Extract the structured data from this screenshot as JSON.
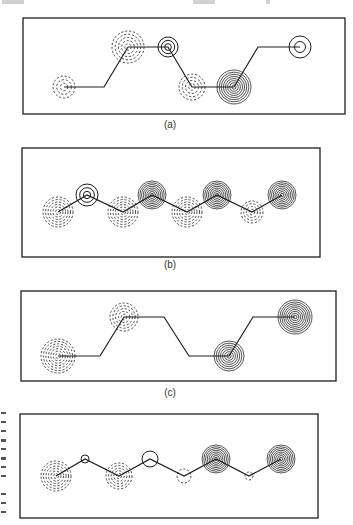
{
  "figure": {
    "colors": {
      "ink": "#1e1e1e",
      "paper": "#ffffff"
    },
    "panels": [
      {
        "id": "a",
        "label": "(a)",
        "box": {
          "x": 23,
          "y": 18,
          "w": 322,
          "h": 96
        },
        "label_pos": {
          "x": 170,
          "y": 120
        },
        "path": [
          [
            64,
            87
          ],
          [
            104,
            87
          ],
          [
            128,
            47
          ],
          [
            168,
            47
          ],
          [
            192,
            87
          ],
          [
            234,
            87
          ],
          [
            258,
            47
          ],
          [
            300,
            47
          ]
        ],
        "orbitals": [
          {
            "x": 64,
            "y": 87,
            "r": 11,
            "rings": 3,
            "sign": "negative"
          },
          {
            "x": 128,
            "y": 47,
            "r": 16,
            "rings": 5,
            "sign": "negative"
          },
          {
            "x": 168,
            "y": 47,
            "r": 10,
            "rings": 3,
            "sign": "positive"
          },
          {
            "x": 192,
            "y": 87,
            "r": 13,
            "rings": 4,
            "sign": "negative"
          },
          {
            "x": 234,
            "y": 87,
            "r": 17,
            "rings": 8,
            "sign": "positive"
          },
          {
            "x": 300,
            "y": 47,
            "r": 11,
            "rings": 2,
            "sign": "positive"
          }
        ]
      },
      {
        "id": "b",
        "label": "(b)",
        "box": {
          "x": 22,
          "y": 148,
          "w": 298,
          "h": 109
        },
        "label_pos": {
          "x": 155,
          "y": 260
        },
        "path": [
          [
            58,
            212
          ],
          [
            87,
            195
          ],
          [
            123,
            212
          ],
          [
            152,
            195
          ],
          [
            187,
            212
          ],
          [
            217,
            195
          ],
          [
            252,
            212
          ],
          [
            282,
            195
          ]
        ],
        "orbitals": [
          {
            "x": 58,
            "y": 212,
            "r": 15,
            "rings": 6,
            "sign": "negative"
          },
          {
            "x": 87,
            "y": 195,
            "r": 11,
            "rings": 3,
            "sign": "positive"
          },
          {
            "x": 123,
            "y": 212,
            "r": 15,
            "rings": 6,
            "sign": "negative"
          },
          {
            "x": 152,
            "y": 195,
            "r": 14,
            "rings": 8,
            "sign": "positive"
          },
          {
            "x": 187,
            "y": 212,
            "r": 15,
            "rings": 6,
            "sign": "negative"
          },
          {
            "x": 217,
            "y": 195,
            "r": 14,
            "rings": 8,
            "sign": "positive"
          },
          {
            "x": 252,
            "y": 212,
            "r": 11,
            "rings": 4,
            "sign": "negative"
          },
          {
            "x": 282,
            "y": 195,
            "r": 14,
            "rings": 8,
            "sign": "positive"
          }
        ]
      },
      {
        "id": "c",
        "label": "(c)",
        "box": {
          "x": 21,
          "y": 291,
          "w": 315,
          "h": 90
        },
        "label_pos": {
          "x": 155,
          "y": 387
        },
        "path": [
          [
            58,
            356
          ],
          [
            100,
            356
          ],
          [
            124,
            317
          ],
          [
            164,
            317
          ],
          [
            189,
            356
          ],
          [
            229,
            356
          ],
          [
            253,
            317
          ],
          [
            295,
            317
          ]
        ],
        "orbitals": [
          {
            "x": 58,
            "y": 356,
            "r": 17,
            "rings": 7,
            "sign": "negative"
          },
          {
            "x": 124,
            "y": 317,
            "r": 14,
            "rings": 5,
            "sign": "negative"
          },
          {
            "x": 229,
            "y": 356,
            "r": 15,
            "rings": 7,
            "sign": "positive"
          },
          {
            "x": 295,
            "y": 317,
            "r": 17,
            "rings": 9,
            "sign": "positive"
          }
        ]
      },
      {
        "id": "d",
        "label": "",
        "box": {
          "x": 20,
          "y": 414,
          "w": 298,
          "h": 104
        },
        "label_pos": null,
        "path": [
          [
            56,
            476
          ],
          [
            85,
            459
          ],
          [
            119,
            476
          ],
          [
            150,
            459
          ],
          [
            184,
            476
          ],
          [
            216,
            459
          ],
          [
            249,
            476
          ],
          [
            281,
            459
          ]
        ],
        "orbitals": [
          {
            "x": 56,
            "y": 476,
            "r": 15,
            "rings": 6,
            "sign": "negative"
          },
          {
            "x": 85,
            "y": 459,
            "r": 4,
            "rings": 1,
            "sign": "positive"
          },
          {
            "x": 119,
            "y": 476,
            "r": 13,
            "rings": 5,
            "sign": "negative"
          },
          {
            "x": 150,
            "y": 459,
            "r": 8,
            "rings": 1,
            "sign": "positive"
          },
          {
            "x": 184,
            "y": 476,
            "r": 7,
            "rings": 1,
            "sign": "negative"
          },
          {
            "x": 216,
            "y": 459,
            "r": 14,
            "rings": 8,
            "sign": "positive"
          },
          {
            "x": 249,
            "y": 476,
            "r": 4,
            "rings": 1,
            "sign": "negative"
          },
          {
            "x": 281,
            "y": 459,
            "r": 14,
            "rings": 8,
            "sign": "positive"
          }
        ]
      }
    ]
  }
}
